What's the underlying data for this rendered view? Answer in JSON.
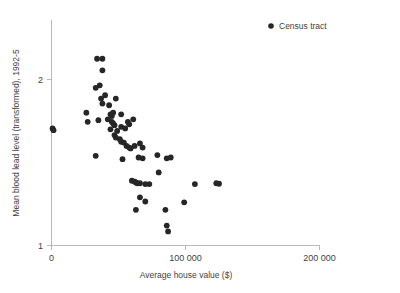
{
  "chart_data": {
    "type": "scatter",
    "title": "",
    "xlabel": "Average house value ($)",
    "ylabel": "Mean blood lead level (transformed), 1992-5",
    "xlim": [
      0,
      200000
    ],
    "ylim": [
      1,
      2.35
    ],
    "xticks": [
      0,
      100000,
      200000
    ],
    "xticklabels": [
      "0",
      "100 000",
      "200 000"
    ],
    "yticks": [
      1,
      2
    ],
    "yticklabels": [
      "1",
      "2"
    ],
    "grid": false,
    "legend_position": "top-right",
    "series": [
      {
        "name": "Census tract",
        "marker": "circle",
        "color": "#262626",
        "points": [
          [
            800,
            1.705
          ],
          [
            1500,
            1.695
          ],
          [
            26000,
            1.8
          ],
          [
            27000,
            1.745
          ],
          [
            33000,
            1.54
          ],
          [
            34000,
            2.125
          ],
          [
            38000,
            2.125
          ],
          [
            33000,
            1.95
          ],
          [
            36000,
            1.965
          ],
          [
            38000,
            2.055
          ],
          [
            37000,
            1.885
          ],
          [
            35000,
            1.755
          ],
          [
            40000,
            1.905
          ],
          [
            38000,
            1.855
          ],
          [
            43000,
            1.845
          ],
          [
            48000,
            1.885
          ],
          [
            44000,
            1.79
          ],
          [
            45000,
            1.78
          ],
          [
            46000,
            1.8
          ],
          [
            42000,
            1.76
          ],
          [
            52000,
            1.79
          ],
          [
            45000,
            1.745
          ],
          [
            46000,
            1.735
          ],
          [
            47000,
            1.725
          ],
          [
            44000,
            1.7
          ],
          [
            49000,
            1.69
          ],
          [
            52000,
            1.715
          ],
          [
            57000,
            1.745
          ],
          [
            61000,
            1.76
          ],
          [
            55000,
            1.705
          ],
          [
            58000,
            1.73
          ],
          [
            47000,
            1.665
          ],
          [
            48000,
            1.65
          ],
          [
            51000,
            1.64
          ],
          [
            52000,
            1.625
          ],
          [
            54000,
            1.62
          ],
          [
            56000,
            1.6
          ],
          [
            58000,
            1.59
          ],
          [
            59000,
            1.585
          ],
          [
            62000,
            1.6
          ],
          [
            66000,
            1.615
          ],
          [
            68000,
            1.59
          ],
          [
            53000,
            1.52
          ],
          [
            65000,
            1.53
          ],
          [
            68000,
            1.525
          ],
          [
            79000,
            1.545
          ],
          [
            86000,
            1.525
          ],
          [
            89000,
            1.53
          ],
          [
            80000,
            1.44
          ],
          [
            60000,
            1.39
          ],
          [
            62000,
            1.385
          ],
          [
            63000,
            1.38
          ],
          [
            64000,
            1.375
          ],
          [
            66000,
            1.375
          ],
          [
            70000,
            1.37
          ],
          [
            73000,
            1.37
          ],
          [
            107000,
            1.37
          ],
          [
            123000,
            1.375
          ],
          [
            125000,
            1.372
          ],
          [
            66000,
            1.29
          ],
          [
            70000,
            1.265
          ],
          [
            99000,
            1.26
          ],
          [
            63000,
            1.215
          ],
          [
            85000,
            1.215
          ],
          [
            86000,
            1.12
          ],
          [
            87000,
            1.085
          ]
        ]
      }
    ]
  },
  "legend": {
    "entries": [
      {
        "label": "Census tract",
        "marker_color": "#262626"
      }
    ]
  }
}
